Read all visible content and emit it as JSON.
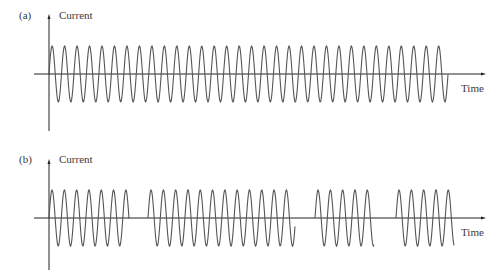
{
  "panels": [
    {
      "id": "a",
      "label": "(a)",
      "y_label": "Current",
      "x_label": "Time",
      "description": "Continuous sinusoidal current",
      "axis_y": 74,
      "amplitude": 28,
      "period": 12.47,
      "segments": [
        [
          49,
          448
        ]
      ]
    },
    {
      "id": "b",
      "label": "(b)",
      "y_label": "Current",
      "x_label": "Time",
      "description": "Burst (pulsed) sinusoidal current",
      "axis_y": 218,
      "amplitude": 28,
      "period": 12.3,
      "segments": [
        [
          49,
          129
        ],
        [
          148,
          295
        ],
        [
          315,
          374
        ],
        [
          396,
          454
        ]
      ]
    }
  ],
  "colors": {
    "axis": "#222222",
    "wave": "#555555",
    "text": "#3a3a3a"
  }
}
